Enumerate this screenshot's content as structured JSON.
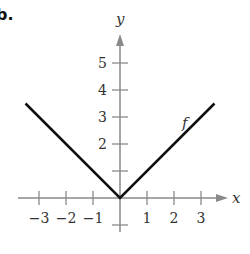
{
  "part_label": "b.",
  "chart_data": {
    "type": "line",
    "title": "",
    "xlabel": "x",
    "ylabel": "y",
    "xlim": [
      -3.5,
      3.5
    ],
    "ylim": [
      -1,
      5.5
    ],
    "x_ticks": [
      -3,
      -2,
      -1,
      1,
      2,
      3
    ],
    "x_tick_labels": [
      "−3",
      "−2",
      "−1",
      "1",
      "2",
      "3"
    ],
    "y_ticks": [
      -1,
      1,
      2,
      3,
      4,
      5
    ],
    "y_tick_labels": [
      "",
      "",
      "2",
      "3",
      "4",
      "5"
    ],
    "grid": false,
    "legend": null,
    "series": [
      {
        "name": "f",
        "x": [
          -3.5,
          0,
          3.5
        ],
        "values": [
          3.5,
          0,
          3.5
        ],
        "color": "#111111"
      }
    ],
    "annotations": [
      {
        "text": "f",
        "x": 2.0,
        "y": 2.6
      }
    ]
  }
}
